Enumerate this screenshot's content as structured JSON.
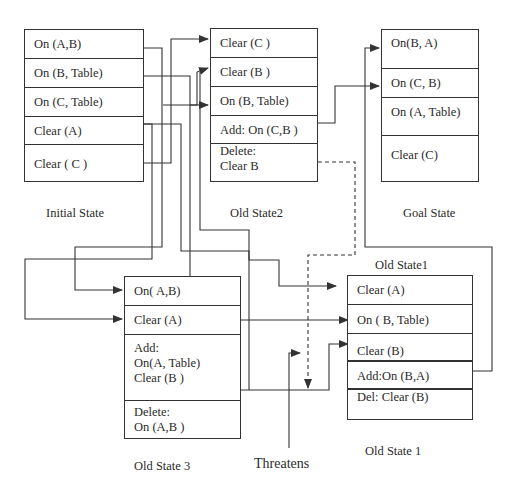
{
  "diagram": {
    "initial_state": {
      "caption": "Initial State",
      "rows": [
        "On (A,B)",
        "On (B, Table)",
        "On (C, Table)",
        "Clear (A)",
        "Clear ( C )"
      ]
    },
    "old_state2": {
      "caption": "Old State2",
      "rows": [
        "Clear (C )",
        "Clear (B )",
        "On (B, Table)",
        "Add: On (C,B )",
        "Delete:\nClear B"
      ]
    },
    "goal_state": {
      "caption": "Goal State",
      "rows": [
        "On(B, A)",
        "On (C, B)",
        "On (A, Table)",
        "Clear (C)"
      ]
    },
    "old_state3": {
      "caption": "Old State 3",
      "rows": [
        "On( A,B)",
        "Clear (A)",
        "Add:\nOn(A, Table)\nClear (B )",
        "Delete:\nOn (A,B )"
      ]
    },
    "old_state1": {
      "caption_top": "Old State1",
      "caption_bottom": "Old State 1",
      "rows": [
        "Clear  (A)",
        "On ( B, Table)",
        "Clear (B)",
        "Add:On (B,A)",
        "Del: Clear (B)"
      ]
    },
    "threatens_label": "Threatens",
    "colors": {
      "line": "#333333",
      "text": "#2a2a2a",
      "background": "#ffffff"
    }
  }
}
